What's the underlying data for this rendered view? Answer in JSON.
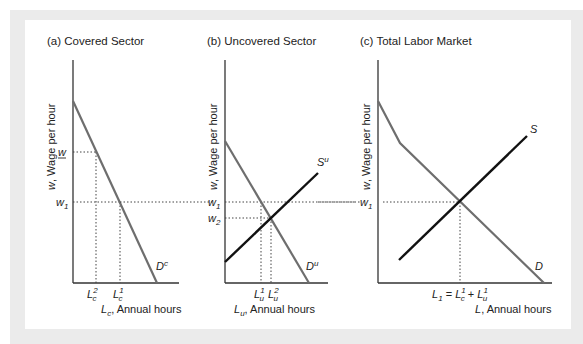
{
  "figure": {
    "panels": [
      {
        "id": "a",
        "title": "(a) Covered Sector",
        "ylabel_var": "w",
        "ylabel_text": ", Wage per hour",
        "xlabel_var": "L",
        "xlabel_sub": "c",
        "xlabel_text": ", Annual hours",
        "wage_labels": [
          "w",
          "w1"
        ],
        "quantity_labels": [
          "Lc2",
          "Lc1"
        ],
        "curve_labels": [
          "Dc"
        ]
      },
      {
        "id": "b",
        "title": "(b) Uncovered Sector",
        "ylabel_var": "w",
        "ylabel_text": ", Wage per hour",
        "xlabel_var": "L",
        "xlabel_sub": "u",
        "xlabel_text": ", Annual hours",
        "wage_labels": [
          "w1",
          "w2"
        ],
        "quantity_labels": [
          "Lu1",
          "Lu2"
        ],
        "curve_labels": [
          "Su",
          "Du"
        ]
      },
      {
        "id": "c",
        "title": "(c) Total Labor Market",
        "ylabel_var": "w",
        "ylabel_text": ", Wage per hour",
        "xlabel_var": "L",
        "xlabel_text": ", Annual hours",
        "wage_labels": [
          "w1"
        ],
        "quantity_labels": [
          "L1 = Lc1 + Lu1"
        ],
        "curve_labels": [
          "S",
          "D"
        ]
      }
    ],
    "colors": {
      "demand": "#6e6e6e",
      "supply": "#111111",
      "axis": "#333333",
      "guide": "#444444",
      "outer_bg": "#ebebeb",
      "panel_bg": "#ffffff"
    }
  },
  "labels": {
    "a_title": "(a) Covered Sector",
    "b_title": "(b) Uncovered Sector",
    "c_title": "(c) Total Labor Market",
    "ylabel": ", Wage per hour",
    "w_var": "w",
    "L_var": "L",
    "annual_hours": ", Annual hours",
    "sub_c": "c",
    "sub_u": "u",
    "sub_1": "1",
    "sub_2": "2",
    "D": "D",
    "S": "S",
    "eq": " = ",
    "plus": " + "
  }
}
